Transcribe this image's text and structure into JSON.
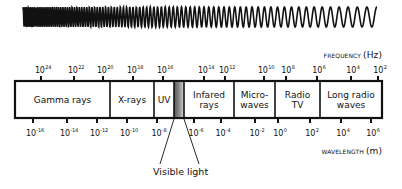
{
  "diagram": {
    "frequency_axis": {
      "label": "FREQUENCY",
      "unit": "(Hz)",
      "ticks": [
        {
          "base": "10",
          "exp": "24",
          "x": 41
        },
        {
          "base": "10",
          "exp": "22",
          "x": 74
        },
        {
          "base": "10",
          "exp": "20",
          "x": 103
        },
        {
          "base": "10",
          "exp": "18",
          "x": 133
        },
        {
          "base": "10",
          "exp": "16",
          "x": 163
        },
        {
          "base": "10",
          "exp": "14",
          "x": 204
        },
        {
          "base": "10",
          "exp": "12",
          "x": 225
        },
        {
          "base": "10",
          "exp": "10",
          "x": 264
        },
        {
          "base": "10",
          "exp": "8",
          "x": 286
        },
        {
          "base": "10",
          "exp": "6",
          "x": 317
        },
        {
          "base": "10",
          "exp": "4",
          "x": 351
        },
        {
          "base": "10",
          "exp": "2",
          "x": 378
        }
      ]
    },
    "wavelength_axis": {
      "label": "WAVELENGTH",
      "unit": "(m)",
      "ticks": [
        {
          "base": "10",
          "exp": "-16",
          "x": 33
        },
        {
          "base": "10",
          "exp": "-14",
          "x": 67
        },
        {
          "base": "10",
          "exp": "-12",
          "x": 97
        },
        {
          "base": "10",
          "exp": "-10",
          "x": 127
        },
        {
          "base": "10",
          "exp": "-8",
          "x": 157
        },
        {
          "base": "10",
          "exp": "-6",
          "x": 194
        },
        {
          "base": "10",
          "exp": "-4",
          "x": 221
        },
        {
          "base": "10",
          "exp": "-2",
          "x": 255
        },
        {
          "base": "10",
          "exp": "0",
          "x": 278
        },
        {
          "base": "10",
          "exp": "2",
          "x": 310
        },
        {
          "base": "10",
          "exp": "4",
          "x": 341
        },
        {
          "base": "10",
          "exp": "6",
          "x": 371
        }
      ]
    },
    "bands": [
      {
        "label": "Gamma rays",
        "x1": 15,
        "x2": 110
      },
      {
        "label": "X-rays",
        "x1": 110,
        "x2": 154
      },
      {
        "label": "UV",
        "x1": 154,
        "x2": 174
      },
      {
        "label": "",
        "x1": 174,
        "x2": 184,
        "visible": true
      },
      {
        "label": "Infared rays",
        "x1": 184,
        "x2": 234
      },
      {
        "label": "Micro-waves",
        "x1": 234,
        "x2": 275
      },
      {
        "label": "Radio TV",
        "x1": 275,
        "x2": 320
      },
      {
        "label": "Long radio waves",
        "x1": 320,
        "x2": 382
      }
    ],
    "callout": {
      "label": "Visible light"
    },
    "colors": {
      "line": "#111111",
      "background": "#ffffff",
      "visible_band_dark": "#444444",
      "visible_band_light": "#cccccc"
    }
  }
}
